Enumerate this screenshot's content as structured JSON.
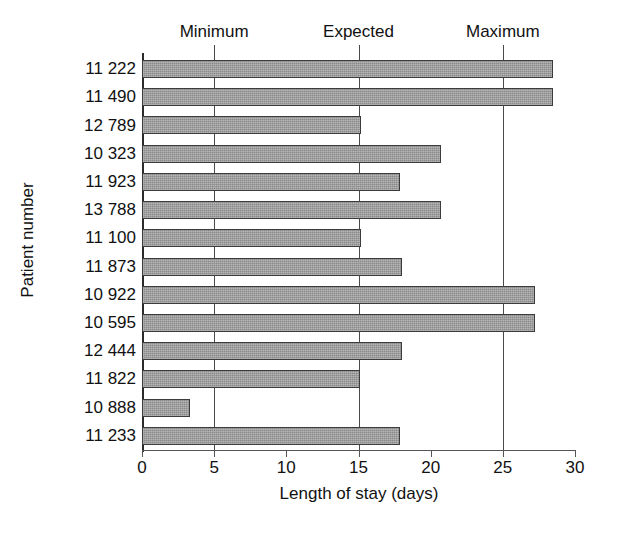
{
  "chart_data": {
    "type": "bar",
    "orientation": "horizontal",
    "title": "",
    "xlabel": "Length of stay (days)",
    "ylabel": "Patient number",
    "xlim": [
      0,
      30
    ],
    "xticks": [
      "0",
      "5",
      "10",
      "15",
      "20",
      "25",
      "30"
    ],
    "xtick_values": [
      0,
      5,
      10,
      15,
      20,
      25,
      30
    ],
    "grid": false,
    "legend": "none",
    "bar_color": "#8a8a8a",
    "bar_border_color": "#3c3c3c",
    "axis_color": "#2b2b2b",
    "categories": [
      "11 222",
      "11 490",
      "12 789",
      "10 323",
      "11 923",
      "13 788",
      "11 100",
      "11 873",
      "10 922",
      "10 595",
      "12 444",
      "11 822",
      "10 888",
      "11 233"
    ],
    "values": [
      28.5,
      28.5,
      15.2,
      20.7,
      17.9,
      20.7,
      15.2,
      18.0,
      27.2,
      27.2,
      18.0,
      15.1,
      3.3,
      17.9
    ],
    "reference_lines": [
      {
        "label": "Minimum",
        "value": 5
      },
      {
        "label": "Expected",
        "value": 15
      },
      {
        "label": "Maximum",
        "value": 25
      }
    ]
  }
}
